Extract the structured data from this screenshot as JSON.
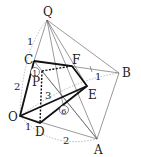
{
  "points": {
    "Q": {
      "label": "Q",
      "x": 47,
      "y": 20
    },
    "C": {
      "label": "C",
      "x": 34,
      "y": 61
    },
    "F": {
      "label": "F",
      "x": 72,
      "y": 66
    },
    "B": {
      "label": "B",
      "x": 119,
      "y": 73
    },
    "P": {
      "label": "P",
      "x": 42,
      "y": 71
    },
    "E": {
      "label": "E",
      "x": 87,
      "y": 86
    },
    "O": {
      "label": "O",
      "x": 20,
      "y": 116
    },
    "D": {
      "label": "D",
      "x": 40,
      "y": 123
    },
    "A": {
      "label": "A",
      "x": 97,
      "y": 139
    }
  },
  "lengths": {
    "QC": "1",
    "CO": "2",
    "OD": "1",
    "DA": "2",
    "FB": "1",
    "PD": "3"
  },
  "circled": {
    "one": "1",
    "six": "6"
  }
}
